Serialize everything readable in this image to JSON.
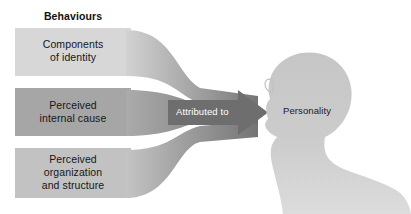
{
  "diagram": {
    "title_label": "Behaviours",
    "background_color": "#ffffff",
    "boxes": [
      {
        "name": "components-of-identity",
        "text": "Components\nof identity",
        "fill": "#d7d7d7",
        "x": 15,
        "y": 28,
        "w": 116,
        "h": 48
      },
      {
        "name": "perceived-internal-cause",
        "text": "Perceived\ninternal cause",
        "fill": "#a6a6a6",
        "x": 15,
        "y": 88,
        "w": 116,
        "h": 48
      },
      {
        "name": "perceived-organization-and-structure",
        "text": "Perceived\norganization\nand structure",
        "fill": "#c2c2c2",
        "x": 15,
        "y": 148,
        "w": 116,
        "h": 50
      }
    ],
    "ribbons": [
      {
        "name": "ribbon-from-components",
        "from": "components-of-identity",
        "light": "#cfcfcf",
        "dark": "#7b7b7b"
      },
      {
        "name": "ribbon-from-internal-cause",
        "from": "perceived-internal-cause",
        "light": "#a9a9a9",
        "dark": "#6f6f6f"
      },
      {
        "name": "ribbon-from-organization",
        "from": "perceived-organization-and-structure",
        "light": "#c0c0c0",
        "dark": "#767676"
      }
    ],
    "arrow": {
      "name": "attributed-to-arrow",
      "label": "Attributed to",
      "fill": "#6e6e6e",
      "label_color": "#ffffff",
      "tip_x": 268
    },
    "figure": {
      "name": "personality-silhouette",
      "label": "Personality",
      "fill": "#cbcbcb",
      "label_color": "#1b1b1b",
      "description": "female head and shoulders profile facing left"
    }
  }
}
